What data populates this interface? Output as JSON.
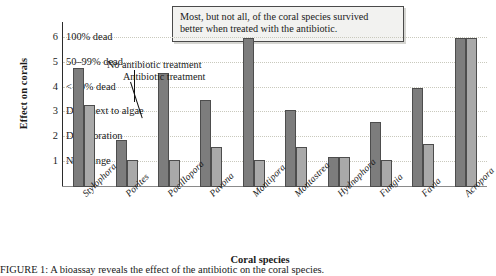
{
  "callout": {
    "line1": "Most, but not all, of the coral species survived",
    "line2": "better when treated with the antibiotic."
  },
  "legend": {
    "series1": "No antibiotic treatment",
    "series2": "Antibiotic treatment"
  },
  "caption": {
    "text": "FIGURE 1: A bioassay reveals the effect of the antibiotic on the coral species."
  },
  "chart_data": {
    "type": "bar",
    "title": "",
    "xlabel": "Coral species",
    "ylabel": "Effect on corals",
    "ylim": [
      0,
      6.6
    ],
    "grid": true,
    "legend_position": "inside-top-left-annotated",
    "ytick_values": [
      1,
      2,
      3,
      4,
      5,
      6
    ],
    "ytick_labels": [
      "No change",
      "Discoloration",
      "Dead next to algae",
      "< 50% dead",
      "50–99% dead",
      "100% dead"
    ],
    "categories": [
      "Stylophora",
      "Porites",
      "Pocillopora",
      "Pavona",
      "Montipora",
      "Montastrea",
      "Hydnophora",
      "Fungia",
      "Favia",
      "Acropora"
    ],
    "series": [
      {
        "name": "No antibiotic treatment",
        "color": "#7d7d7d",
        "values": [
          4.8,
          1.9,
          4.6,
          3.5,
          6.0,
          3.1,
          1.2,
          2.6,
          4.0,
          6.0
        ]
      },
      {
        "name": "Antibiotic treatment",
        "color": "#a9a9a9",
        "values": [
          3.3,
          1.1,
          1.1,
          1.6,
          1.1,
          1.6,
          1.2,
          1.1,
          1.75,
          6.0
        ]
      }
    ]
  }
}
